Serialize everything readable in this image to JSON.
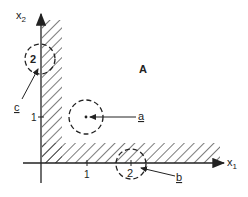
{
  "diagram": {
    "axes": {
      "x_label": "x",
      "x_sub": "1",
      "y_label": "x",
      "y_sub": "2",
      "x_ticks": [
        {
          "label": "1",
          "x": 87
        },
        {
          "label": "2",
          "x": 131
        }
      ],
      "y_ticks": [
        {
          "label": "1",
          "y": 117
        }
      ]
    },
    "region_label": "A",
    "points": {
      "a": {
        "label": "a",
        "center_label": ""
      },
      "b": {
        "label": "b",
        "center_label": "2"
      },
      "c": {
        "label": "c",
        "center_label": "2"
      }
    },
    "colors": {
      "ink": "#222222",
      "background": "#ffffff"
    }
  }
}
